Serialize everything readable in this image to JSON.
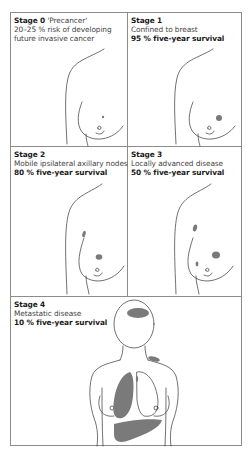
{
  "figure": {
    "type": "breast cancer staging diagram",
    "colors": {
      "border": "#8c8c8c",
      "line": "#333333",
      "tumor_fill": "#7a7a7a",
      "background": "#ffffff"
    }
  },
  "panels": [
    {
      "stage_label": "Stage 0",
      "stage_suffix": " 'Precancer'",
      "description": "20–25 % risk of developing",
      "description_2": "future invasive cancer",
      "survival": "",
      "illustration": "breast-profile-small-dot"
    },
    {
      "stage_label": "Stage 1",
      "description": "Confined to breast",
      "survival": "95 % five-year survival",
      "illustration": "breast-profile-single-tumor"
    },
    {
      "stage_label": "Stage 2",
      "description": "Mobile ipsilateral axillary nodes",
      "survival": "80 % five-year survival",
      "illustration": "breast-profile-tumor-axillary-node"
    },
    {
      "stage_label": "Stage 3",
      "description": "Locally advanced disease",
      "survival": "50 % five-year survival",
      "illustration": "breast-profile-multiple-tumors-node"
    },
    {
      "stage_label": "Stage 4",
      "description": "Metastatic disease",
      "survival": "10 % five-year survival",
      "illustration": "torso-with-brain-bone-lung-liver-metastases"
    }
  ]
}
